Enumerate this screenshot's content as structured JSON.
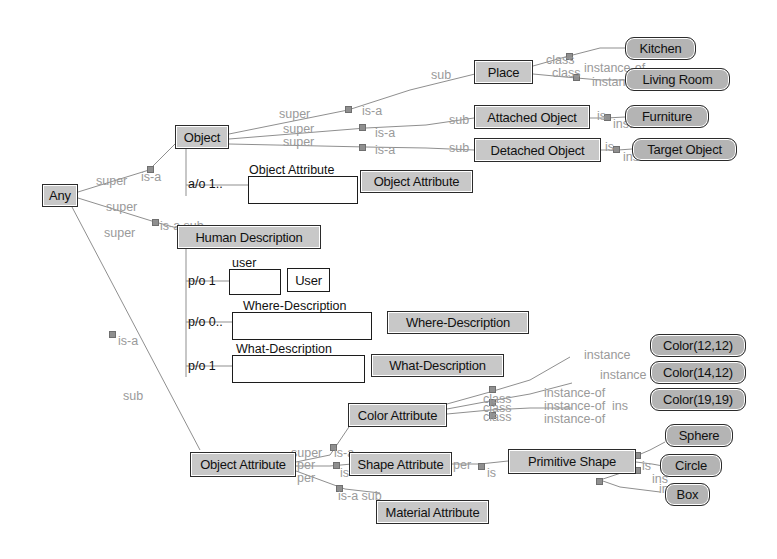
{
  "diagram": {
    "background": "#ffffff",
    "class_node_color": "#c8c8c8",
    "instance_node_color": "#b4b4b4",
    "slot_box_color": "#ffffff",
    "edge_color": "#8f8f8f",
    "edge_label_color": "#9a9a9a"
  },
  "nodes": {
    "any": "Any",
    "object": "Object",
    "place": "Place",
    "attached_object": "Attached Object",
    "detached_object": "Detached Object",
    "object_attribute_top": "Object Attribute",
    "human_description": "Human Description",
    "user_node": "User",
    "where_description_node": "Where-Description",
    "what_description_node": "What-Description",
    "object_attribute_bottom": "Object Attribute",
    "color_attribute": "Color Attribute",
    "shape_attribute": "Shape Attribute",
    "material_attribute": "Material Attribute",
    "primitive_shape": "Primitive Shape"
  },
  "instances": {
    "kitchen": "Kitchen",
    "living_room": "Living Room",
    "furniture": "Furniture",
    "target_object": "Target Object",
    "color_12_12": "Color(12,12)",
    "color_14_12": "Color(14,12)",
    "color_19_19": "Color(19,19)",
    "sphere": "Sphere",
    "circle": "Circle",
    "box": "Box"
  },
  "slots": [
    {
      "id": "object_attribute_slot",
      "caption": "Object Attribute",
      "cardinality": "a/o 1.."
    },
    {
      "id": "user_slot",
      "caption": "user",
      "cardinality": "p/o 1"
    },
    {
      "id": "where_slot",
      "caption": "Where-Description",
      "cardinality": "p/o 0.."
    },
    {
      "id": "what_slot",
      "caption": "What-Description",
      "cardinality": "p/o 1"
    }
  ],
  "edge_labels": {
    "super": "super",
    "sub": "sub",
    "is_a": "is-a",
    "is_a_sub": "is-a sub",
    "class": "class",
    "instance_of": "instance-of",
    "per": "per"
  },
  "edge_label_instances": [
    {
      "text": "super",
      "x": 96,
      "y": 174
    },
    {
      "text": "is-a",
      "x": 141,
      "y": 170
    },
    {
      "text": "super",
      "x": 106,
      "y": 200
    },
    {
      "text": "super",
      "x": 104,
      "y": 226
    },
    {
      "text": "is-a sub",
      "x": 160,
      "y": 219
    },
    {
      "text": "is-a",
      "x": 118,
      "y": 334
    },
    {
      "text": "sub",
      "x": 123,
      "y": 389
    },
    {
      "text": "super",
      "x": 279,
      "y": 107
    },
    {
      "text": "super",
      "x": 283,
      "y": 122
    },
    {
      "text": "super",
      "x": 283,
      "y": 135
    },
    {
      "text": "is-a",
      "x": 362,
      "y": 104
    },
    {
      "text": "is-a",
      "x": 375,
      "y": 126
    },
    {
      "text": "is-a",
      "x": 375,
      "y": 143
    },
    {
      "text": "sub",
      "x": 431,
      "y": 68
    },
    {
      "text": "sub",
      "x": 449,
      "y": 113
    },
    {
      "text": "sub",
      "x": 449,
      "y": 141
    },
    {
      "text": "class",
      "x": 546,
      "y": 53
    },
    {
      "text": "class",
      "x": 552,
      "y": 66
    },
    {
      "text": "instance-of",
      "x": 584,
      "y": 61
    },
    {
      "text": "instance-of",
      "x": 592,
      "y": 75
    },
    {
      "text": "is",
      "x": 597,
      "y": 109
    },
    {
      "text": "instance-of",
      "x": 613,
      "y": 117
    },
    {
      "text": "is",
      "x": 605,
      "y": 140
    },
    {
      "text": "instance-of",
      "x": 623,
      "y": 150
    },
    {
      "text": "class",
      "x": 483,
      "y": 392
    },
    {
      "text": "class",
      "x": 483,
      "y": 401
    },
    {
      "text": "class",
      "x": 483,
      "y": 410
    },
    {
      "text": "instance-of",
      "x": 544,
      "y": 386
    },
    {
      "text": "instance-of",
      "x": 544,
      "y": 399
    },
    {
      "text": "instance-of",
      "x": 544,
      "y": 412
    },
    {
      "text": "instance",
      "x": 584,
      "y": 348
    },
    {
      "text": "instance",
      "x": 600,
      "y": 368
    },
    {
      "text": "ins",
      "x": 612,
      "y": 399
    },
    {
      "text": "super",
      "x": 291,
      "y": 446
    },
    {
      "text": "per",
      "x": 297,
      "y": 458
    },
    {
      "text": "per",
      "x": 297,
      "y": 471
    },
    {
      "text": "is-a",
      "x": 334,
      "y": 446
    },
    {
      "text": "is",
      "x": 340,
      "y": 466
    },
    {
      "text": "is-a sub",
      "x": 338,
      "y": 489
    },
    {
      "text": "per",
      "x": 453,
      "y": 458
    },
    {
      "text": "is",
      "x": 487,
      "y": 466
    },
    {
      "text": "is",
      "x": 642,
      "y": 459
    },
    {
      "text": "ins",
      "x": 652,
      "y": 472
    },
    {
      "text": "instance",
      "x": 659,
      "y": 482
    }
  ]
}
